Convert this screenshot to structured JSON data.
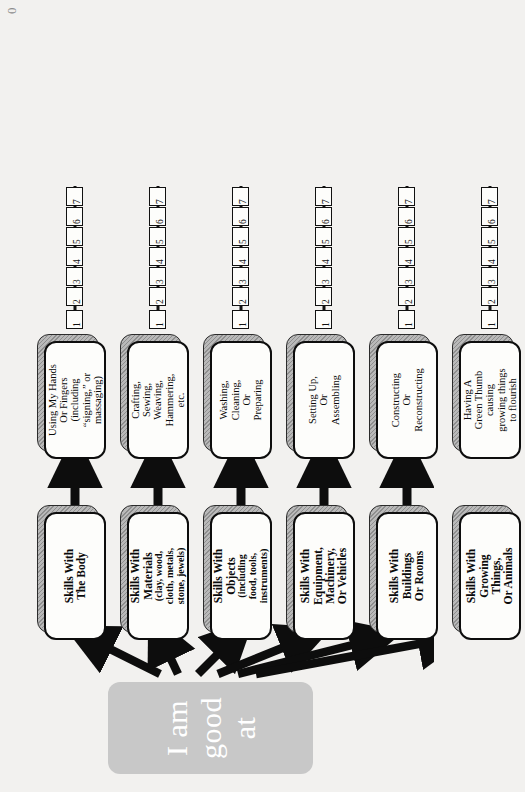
{
  "page": {
    "corner_mark": "0",
    "orientation": "rotated-90",
    "background_color": "#f2f1ef",
    "root_color": "#c8c8c8",
    "ink_color": "#0d0d0d"
  },
  "root": {
    "label": "I am good at"
  },
  "scale": {
    "min": 1,
    "max": 7,
    "ticks": [
      "1",
      "2",
      "3",
      "4",
      "5",
      "6",
      "7"
    ],
    "pointer_at": "4"
  },
  "rows": [
    {
      "skill": "Skills With\nThe Body",
      "skill_sub": "",
      "description": "Using My Hands\nOr Fingers\n(including\n“signing,” or\nmassaging)"
    },
    {
      "skill": "Skills With\nMaterials",
      "skill_sub": "(clay, wood,\ncloth, metals,\nstone, jewels)",
      "description": "Crafting,\nSewing,\nWeaving,\nHammering,\netc."
    },
    {
      "skill": "Skills With\nObjects",
      "skill_sub": "(including\nfood, tools,\ninstruments)",
      "description": "Washing,\nCleaning,\nOr\nPreparing"
    },
    {
      "skill": "Skills With\nEquipment,\nMachinery,\nOr Vehicles",
      "skill_sub": "",
      "description": "Setting Up,\nOr\nAssembling"
    },
    {
      "skill": "Skills With\nBuildings\nOr Rooms",
      "skill_sub": "",
      "description": "Constructing\nOr\nReconstructing"
    },
    {
      "skill": "Skills With\nGrowing\nThings,\nOr Animals",
      "skill_sub": "",
      "description": "Having A\nGreen Thumb\ncausing\ngrowing things\nto flourish"
    }
  ]
}
